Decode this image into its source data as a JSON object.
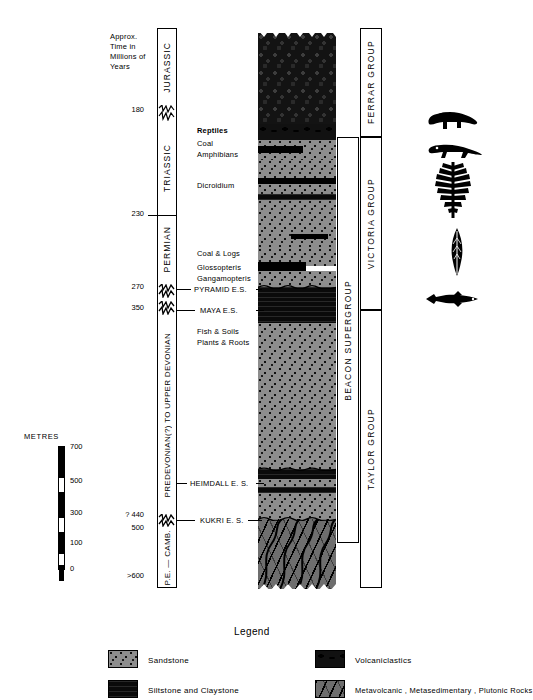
{
  "figure": {
    "time_axis_title_lines": [
      "Approx.",
      "Time in",
      "Millions of",
      "Years"
    ],
    "time_ticks": [
      {
        "value": "180",
        "y": 110
      },
      {
        "value": "230",
        "y": 214
      },
      {
        "value": "270",
        "y": 287
      },
      {
        "value": "350",
        "y": 308
      },
      {
        "value": "? 440",
        "y": 515
      },
      {
        "value": "500",
        "y": 528
      },
      {
        "value": ">600",
        "y": 576
      }
    ],
    "periods": [
      {
        "name": "JURASSIC",
        "top": 28,
        "bottom": 104
      },
      {
        "name": "TRIASSIC",
        "top": 118,
        "bottom": 214
      },
      {
        "name": "PERMIAN",
        "top": 214,
        "bottom": 283
      },
      {
        "name": "PREDEVONIAN(?) TO UPPER DEVONIAN",
        "top": 313,
        "bottom": 518
      },
      {
        "name": "P.E. — CAMB.",
        "top": 524,
        "bottom": 588
      }
    ],
    "annotations": [
      {
        "text": "Reptiles",
        "x": 197,
        "y": 129
      },
      {
        "text": "Coal",
        "x": 197,
        "y": 142
      },
      {
        "text": "Amphibians",
        "x": 197,
        "y": 153
      },
      {
        "text": "Dicroidium",
        "x": 197,
        "y": 183
      },
      {
        "text": "Coal & Logs",
        "x": 197,
        "y": 252
      },
      {
        "text": "Glossopteris",
        "x": 197,
        "y": 266
      },
      {
        "text": "Gangamopteris",
        "x": 197,
        "y": 277
      },
      {
        "text": "Fish & Soils",
        "x": 197,
        "y": 330
      },
      {
        "text": "Plants & Roots",
        "x": 197,
        "y": 341
      }
    ],
    "erosion_surfaces": [
      {
        "text": "PYRAMID  E.S.",
        "x": 194,
        "y": 287
      },
      {
        "text": "MAYA  E.S.",
        "x": 200,
        "y": 308
      },
      {
        "text": "HEIMDALL  E. S.",
        "x": 190,
        "y": 481
      },
      {
        "text": "KUKRI  E. S.",
        "x": 200,
        "y": 518
      }
    ],
    "groups": [
      {
        "name": "FERRAR  GROUP",
        "top": 28,
        "bottom": 137
      },
      {
        "name": "VICTORIA  GROUP",
        "top": 137,
        "bottom": 310
      },
      {
        "name": "TAYLOR  GROUP",
        "top": 310,
        "bottom": 588
      }
    ],
    "supergroup": {
      "name": "BEACON  SUPERGROUP",
      "top": 137,
      "bottom": 543
    },
    "fossil_icons": [
      {
        "name": "reptile-silhouette",
        "y": 112
      },
      {
        "name": "amphibian-silhouette",
        "y": 145
      },
      {
        "name": "fern-silhouette",
        "y": 170
      },
      {
        "name": "leaf-silhouette",
        "y": 235
      },
      {
        "name": "fish-silhouette",
        "y": 295
      }
    ]
  },
  "metres_scale": {
    "title": "METRES",
    "ticks": [
      "700",
      "500",
      "300",
      "100",
      "0"
    ]
  },
  "strat_units": [
    {
      "id": "ferrar-dolerite-basalt",
      "top": 33,
      "height": 67,
      "pattern": "volcanic"
    },
    {
      "id": "volcaniclastic-lens",
      "top": 100,
      "height": 14,
      "pattern": "volcaniclastic"
    },
    {
      "id": "upper-sandstone-1",
      "top": 114,
      "height": 23,
      "pattern": "sandstone"
    },
    {
      "id": "coal-seam-1",
      "top": 137,
      "height": 7,
      "pattern": "coal"
    },
    {
      "id": "sandstone-2",
      "top": 144,
      "height": 34,
      "pattern": "sandstone"
    },
    {
      "id": "coal-seam-2",
      "top": 178,
      "height": 5,
      "pattern": "coal"
    },
    {
      "id": "sandstone-3",
      "top": 183,
      "height": 6,
      "pattern": "sandstone"
    },
    {
      "id": "siltstone-band-1",
      "top": 189,
      "height": 5,
      "pattern": "siltstone"
    },
    {
      "id": "sandstone-4",
      "top": 194,
      "height": 46,
      "pattern": "sandstone"
    },
    {
      "id": "coal-lens-3",
      "top": 240,
      "height": 6,
      "pattern": "coal"
    },
    {
      "id": "sandstone-5",
      "top": 246,
      "height": 18,
      "pattern": "sandstone"
    },
    {
      "id": "coal-seam-4",
      "top": 264,
      "height": 9,
      "pattern": "coal"
    },
    {
      "id": "sandstone-6",
      "top": 273,
      "height": 14,
      "pattern": "sandstone"
    },
    {
      "id": "permian-siltstone",
      "top": 287,
      "height": 12,
      "pattern": "siltstone"
    },
    {
      "id": "maya-siltstone",
      "top": 299,
      "height": 20,
      "pattern": "siltstone"
    },
    {
      "id": "devonian-sandstone-1",
      "top": 319,
      "height": 146,
      "pattern": "sandstone"
    },
    {
      "id": "siltstone-band-2",
      "top": 465,
      "height": 9,
      "pattern": "siltstone"
    },
    {
      "id": "devonian-sandstone-2",
      "top": 474,
      "height": 14,
      "pattern": "sandstone"
    },
    {
      "id": "heimdall-siltstone",
      "top": 488,
      "height": 6,
      "pattern": "siltstone"
    },
    {
      "id": "devonian-sandstone-3",
      "top": 494,
      "height": 24,
      "pattern": "sandstone"
    },
    {
      "id": "basement-complex",
      "top": 518,
      "height": 70,
      "pattern": "basement"
    }
  ],
  "legend": {
    "title": "Legend",
    "items": [
      {
        "label": "Sandstone",
        "pattern": "sandstone",
        "col": 0,
        "row": 0
      },
      {
        "label": "Siltstone and  Claystone",
        "pattern": "siltstone",
        "col": 0,
        "row": 1
      },
      {
        "label": "Volcaniclastics",
        "pattern": "volcaniclastic",
        "col": 1,
        "row": 0
      },
      {
        "label": "Metavolcanic ,  Metasedimentary ,  Plutonic  Rocks",
        "pattern": "basement",
        "col": 1,
        "row": 1
      }
    ]
  }
}
